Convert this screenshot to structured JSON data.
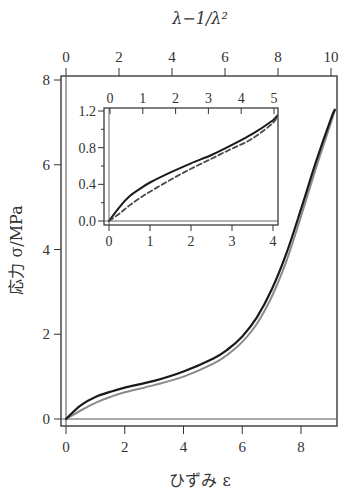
{
  "chart_data": [
    {
      "type": "line",
      "role": "main",
      "title": "",
      "xlabel": "ひずみ ε",
      "ylabel": "応力 σ/MPa",
      "top_xlabel": "λ−1/λ²",
      "xlim": [
        0,
        9.2
      ],
      "ylim": [
        0,
        8
      ],
      "top_xlim": [
        0,
        10
      ],
      "x_ticks": [
        "0",
        "2",
        "4",
        "6",
        "8"
      ],
      "y_ticks": [
        "0",
        "2",
        "4",
        "6",
        "8"
      ],
      "top_x_ticks": [
        "0",
        "2",
        "4",
        "6",
        "8",
        "10"
      ],
      "grid": false,
      "legend": null,
      "series": [
        {
          "name": "Measured (black)",
          "color": "#1a1a1a",
          "x": [
            0,
            0.5,
            1,
            1.5,
            2,
            3,
            4,
            5,
            5.5,
            6,
            6.5,
            7,
            7.5,
            8,
            8.5,
            9,
            9.15
          ],
          "y": [
            0,
            0.32,
            0.52,
            0.64,
            0.74,
            0.9,
            1.12,
            1.42,
            1.64,
            1.95,
            2.4,
            3.05,
            3.9,
            4.95,
            6.05,
            7.05,
            7.3
          ]
        },
        {
          "name": "Model (gray)",
          "color": "#8a8a8a",
          "x": [
            0,
            0.5,
            1,
            1.5,
            2,
            3,
            4,
            5,
            5.5,
            6,
            6.5,
            7,
            7.5,
            8,
            8.5,
            9,
            9.15
          ],
          "y": [
            0,
            0.2,
            0.38,
            0.52,
            0.63,
            0.8,
            1.0,
            1.3,
            1.52,
            1.82,
            2.25,
            2.88,
            3.72,
            4.78,
            5.9,
            6.95,
            7.28
          ]
        }
      ]
    },
    {
      "type": "line",
      "role": "inset",
      "xlabel": "",
      "ylabel": "",
      "xlim": [
        0,
        4.1
      ],
      "ylim": [
        0,
        1.2
      ],
      "top_xlim": [
        0,
        5
      ],
      "x_ticks": [
        "0",
        "1",
        "2",
        "3",
        "4"
      ],
      "y_ticks": [
        "0.0",
        "0.4",
        "0.8",
        "1.2"
      ],
      "top_x_ticks": [
        "0",
        "1",
        "2",
        "3",
        "4",
        "5"
      ],
      "grid": false,
      "series": [
        {
          "name": "Measured (solid)",
          "style": "solid",
          "color": "#1a1a1a",
          "x": [
            0,
            0.25,
            0.5,
            0.75,
            1,
            1.5,
            2,
            2.5,
            3,
            3.5,
            4,
            4.1
          ],
          "y": [
            0,
            0.15,
            0.27,
            0.35,
            0.42,
            0.53,
            0.63,
            0.72,
            0.83,
            0.95,
            1.1,
            1.15
          ]
        },
        {
          "name": "Model (dashed)",
          "style": "dashed",
          "color": "#4a4a4a",
          "x": [
            0,
            0.25,
            0.5,
            0.75,
            1,
            1.5,
            2,
            2.5,
            3,
            3.5,
            4,
            4.1
          ],
          "y": [
            0,
            0.08,
            0.17,
            0.25,
            0.32,
            0.45,
            0.57,
            0.68,
            0.79,
            0.9,
            1.07,
            1.15
          ]
        }
      ]
    }
  ],
  "labels": {
    "top_axis_title": "λ−1/λ²",
    "y_axis_title": "応力 σ/MPa",
    "x_axis_title": "ひずみ ε"
  }
}
